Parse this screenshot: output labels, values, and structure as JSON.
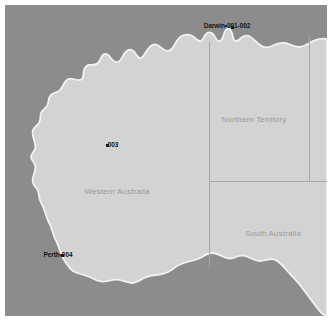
{
  "map": {
    "region": "Australia (western and central)",
    "colors": {
      "ocean": "#8c8c8c",
      "land": "#d3d3d3",
      "coastline": "#f2f2f2",
      "state_border": "#a8a8a8",
      "frame": "#ffffff",
      "marker_dot": "#1a1a1a",
      "marker_label": "#141414",
      "state_label": "#9a9a9a"
    },
    "state_labels": [
      {
        "name": "northern-territory",
        "text": "Northern Territory",
        "x": 249,
        "y": 114
      },
      {
        "name": "western-australia",
        "text": "Western Australia",
        "x": 112,
        "y": 186
      },
      {
        "name": "south-australia",
        "text": "South Australia",
        "x": 268,
        "y": 228
      }
    ],
    "markers": [
      {
        "name": "darwin",
        "city": "Darwin",
        "codes": "001-002",
        "label": "Darwin•001-002",
        "x": 227,
        "y": 22,
        "label_anchor_x": 228,
        "label_anchor_y": 22
      },
      {
        "name": "site-003",
        "city": "",
        "codes": "003",
        "label": "•003",
        "x": 102,
        "y": 140,
        "label_anchor_x": 107,
        "label_anchor_y": 140
      },
      {
        "name": "perth",
        "city": "Perth",
        "codes": "004",
        "label": "Perth•004",
        "x": 57,
        "y": 250,
        "label_anchor_x": 55,
        "label_anchor_y": 250
      }
    ]
  }
}
